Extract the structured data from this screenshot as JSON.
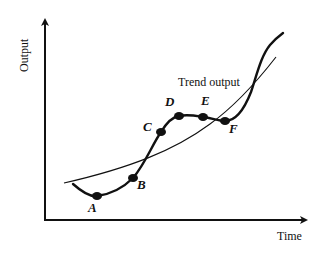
{
  "figure": {
    "y_axis_label": "Output",
    "x_axis_label": "Time",
    "trend_label": "Trend output",
    "points": [
      {
        "label": "A"
      },
      {
        "label": "B"
      },
      {
        "label": "C"
      },
      {
        "label": "D"
      },
      {
        "label": "E"
      },
      {
        "label": "F"
      }
    ]
  },
  "colors": {
    "ink": "#111111",
    "background": "#ffffff"
  }
}
